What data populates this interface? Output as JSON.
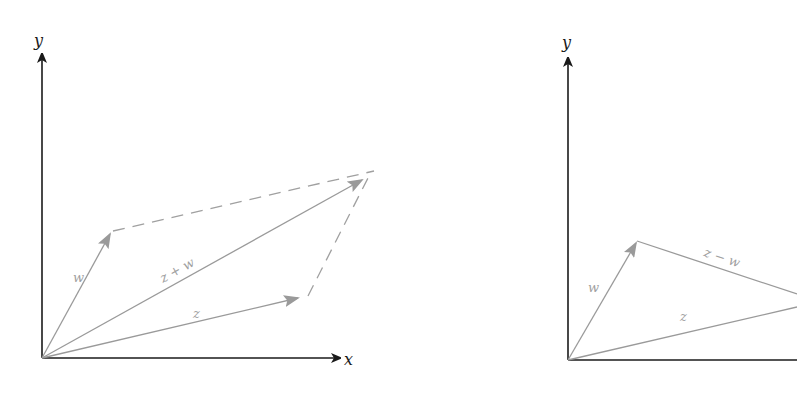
{
  "diagrams": [
    {
      "name": "vector-sum-parallelogram",
      "axis_labels": {
        "x": "x",
        "y": "y"
      },
      "vectors": [
        {
          "id": "w",
          "label": "w"
        },
        {
          "id": "z",
          "label": "z"
        },
        {
          "id": "z_plus_w",
          "label": "z + w"
        }
      ]
    },
    {
      "name": "vector-difference-triangle",
      "axis_labels": {
        "y": "y"
      },
      "vectors": [
        {
          "id": "w",
          "label": "w"
        },
        {
          "id": "z",
          "label": "z"
        },
        {
          "id": "z_minus_w",
          "label": "z − w"
        }
      ]
    }
  ],
  "colors": {
    "axis": "#1a1a1a",
    "vector": "#9a9a9a"
  }
}
